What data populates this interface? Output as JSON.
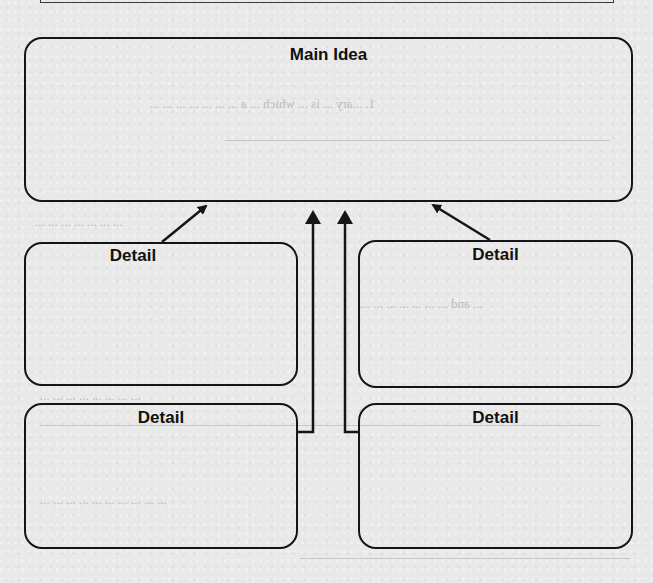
{
  "organizer": {
    "type": "main-idea-and-details graphic organizer",
    "main_idea": {
      "title": "Main Idea"
    },
    "details": [
      {
        "position": "top-left",
        "title": "Detail"
      },
      {
        "position": "top-right",
        "title": "Detail"
      },
      {
        "position": "bottom-left",
        "title": "Detail"
      },
      {
        "position": "bottom-right",
        "title": "Detail"
      }
    ]
  },
  "show_through": {
    "lines": [
      "1. ...ary ... is ... which ... a ... ... ... ... ... ... ...",
      "... ... ... ... ... ... ...",
      "... and ... ... ... ... ... ... ...",
      "... ... ... ... ... ... ... ...",
      "... ... ... ... ... ... ... ... ... ..."
    ]
  },
  "colors": {
    "paper": "#e9e9e9",
    "ink": "#151515",
    "show_through_text": "#b9b9b9"
  }
}
